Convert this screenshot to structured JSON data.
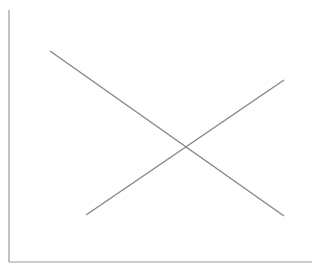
{
  "chart_data": {
    "type": "line",
    "title": "",
    "xlabel": "",
    "ylabel": "",
    "grid": false,
    "legend": null,
    "x": [
      0,
      1
    ],
    "series": [
      {
        "name": "decreasing",
        "values": [
          1,
          0
        ],
        "color": "#888888"
      },
      {
        "name": "increasing",
        "values": [
          0,
          1
        ],
        "color": "#888888"
      }
    ]
  },
  "plot": {
    "axis_color": "#999999",
    "line_color": "#888888",
    "background": "#ffffff"
  }
}
